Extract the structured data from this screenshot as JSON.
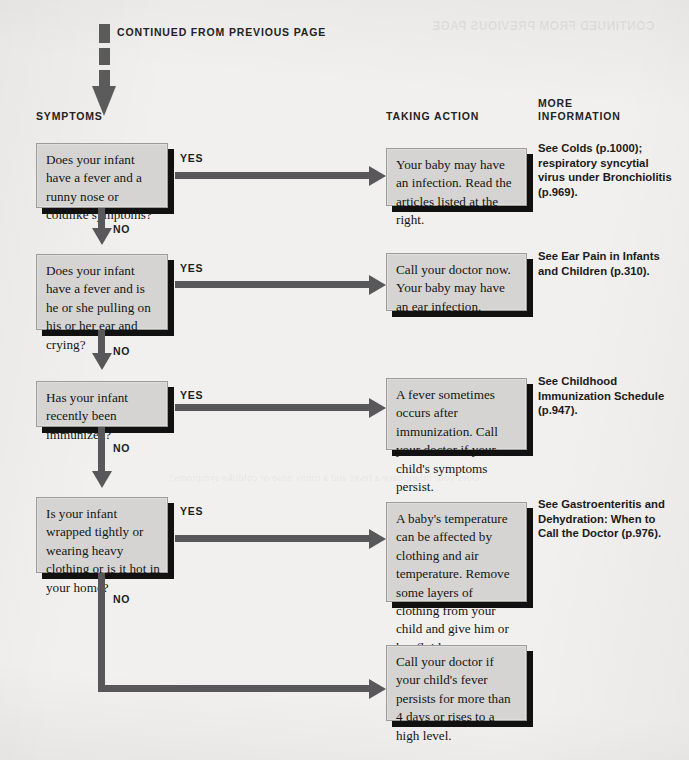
{
  "page": {
    "continued_note": "CONTINUED FROM PREVIOUS PAGE",
    "showthrough_text": "CONTINUED FROM PREVIOUS PAGE",
    "showthrough_text_2": "Does your infant have a fever and a runny nose or coldlike symptoms?",
    "background_color": "#f1f0ee",
    "box_fill_color": "#d5d4d2",
    "box_border_color": "#9d9c99",
    "shadow_color": "#111111",
    "connector_color": "#58585a",
    "text_color": "#141414"
  },
  "columns": {
    "symptoms": "SYMPTOMS",
    "taking_action": "TAKING ACTION",
    "more_information": "MORE\nINFORMATION"
  },
  "labels": {
    "yes": "YES",
    "no": "NO"
  },
  "rows": [
    {
      "symptom": "Does your infant have a fever and a runny nose or coldlike symptoms?",
      "action": "Your baby may have an infection. Read the articles listed at the right.",
      "more_information": "See Colds (p.1000); respiratory syncytial virus under Bronchiolitis (p.969)."
    },
    {
      "symptom": "Does your infant have a fever and is he or she pulling on his or her ear and crying?",
      "action": "Call your doctor now. Your baby may have an ear infection.",
      "more_information": "See Ear Pain in Infants and Children (p.310)."
    },
    {
      "symptom": "Has your infant recently been immunized?",
      "action": "A fever sometimes occurs after immunization. Call your doctor if your child's symptoms persist.",
      "more_information": "See Childhood Immunization Schedule (p.947)."
    },
    {
      "symptom": "Is your infant wrapped tightly or wearing heavy clothing or is it hot in your home?",
      "action": "A baby's temperature can be affected by clothing and air temperature. Remove some layers of clothing from your child and give him or her fluids.",
      "more_information": "See Gastroenteritis and Dehydration: When to Call the Doctor (p.976)."
    }
  ],
  "final": {
    "action": "Call your doctor if your child's fever persists for more than 4 days or rises to a high level.",
    "more_information": ""
  }
}
